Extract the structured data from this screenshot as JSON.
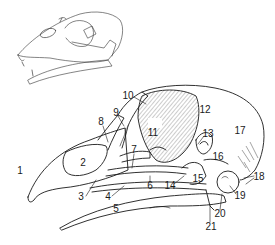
{
  "figure": {
    "inset": "Small outline sketch of skull with beak (upper left)",
    "colors": {
      "ink": "#1a1a1a",
      "background": "#ffffff"
    }
  },
  "labels": [
    {
      "id": "1",
      "text": "1",
      "x": 20,
      "y": 171
    },
    {
      "id": "2",
      "text": "2",
      "x": 56,
      "y": 163
    },
    {
      "id": "3",
      "text": "3",
      "x": 81,
      "y": 197
    },
    {
      "id": "4",
      "text": "4",
      "x": 108,
      "y": 197
    },
    {
      "id": "5",
      "text": "5",
      "x": 116,
      "y": 209
    },
    {
      "id": "6",
      "text": "6",
      "x": 150,
      "y": 186
    },
    {
      "id": "7",
      "text": "7",
      "x": 134,
      "y": 150
    },
    {
      "id": "8",
      "text": "8",
      "x": 101,
      "y": 122
    },
    {
      "id": "9",
      "text": "9",
      "x": 116,
      "y": 113
    },
    {
      "id": "10",
      "text": "10",
      "x": 128,
      "y": 96
    },
    {
      "id": "11",
      "text": "11",
      "x": 153,
      "y": 133
    },
    {
      "id": "12",
      "text": "12",
      "x": 205,
      "y": 110
    },
    {
      "id": "13",
      "text": "13",
      "x": 208,
      "y": 134
    },
    {
      "id": "14",
      "text": "14",
      "x": 170,
      "y": 186
    },
    {
      "id": "15",
      "text": "15",
      "x": 198,
      "y": 179
    },
    {
      "id": "16",
      "text": "16",
      "x": 218,
      "y": 157
    },
    {
      "id": "17",
      "text": "17",
      "x": 240,
      "y": 131
    },
    {
      "id": "18",
      "text": "18",
      "x": 259,
      "y": 177
    },
    {
      "id": "19",
      "text": "19",
      "x": 240,
      "y": 196
    },
    {
      "id": "20",
      "text": "20",
      "x": 220,
      "y": 214
    },
    {
      "id": "21",
      "text": "21",
      "x": 211,
      "y": 227
    }
  ]
}
